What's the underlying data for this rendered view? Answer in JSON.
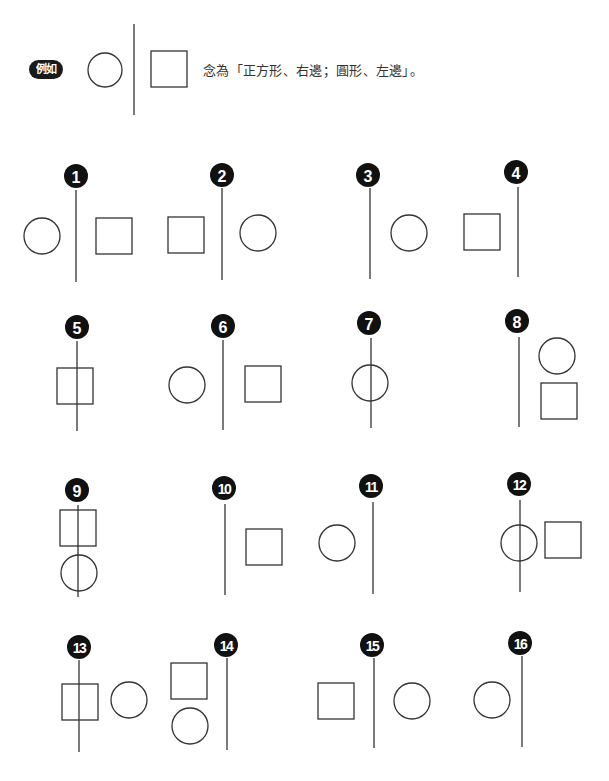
{
  "example": {
    "badge_label": "例如",
    "description": "念為「正方形、右邊；圓形、左邊」。",
    "figure": {
      "line": {
        "x": 134,
        "y1": 24,
        "y2": 115
      },
      "shapes": [
        {
          "type": "circle",
          "cx": 105,
          "cy": 70,
          "r": 17
        },
        {
          "type": "square",
          "x": 151,
          "y": 51,
          "size": 36
        }
      ]
    }
  },
  "exercises": [
    {
      "number": "1",
      "badge": {
        "cx": 76,
        "cy": 176
      },
      "line": {
        "x": 76,
        "y1": 190,
        "y2": 282
      },
      "shapes": [
        {
          "type": "circle",
          "cx": 42,
          "cy": 236,
          "r": 18
        },
        {
          "type": "square",
          "x": 96,
          "y": 218,
          "size": 36
        }
      ]
    },
    {
      "number": "2",
      "badge": {
        "cx": 222,
        "cy": 175
      },
      "line": {
        "x": 222,
        "y1": 188,
        "y2": 280
      },
      "shapes": [
        {
          "type": "square",
          "x": 168,
          "y": 217,
          "size": 36
        },
        {
          "type": "circle",
          "cx": 258,
          "cy": 233,
          "r": 18
        }
      ]
    },
    {
      "number": "3",
      "badge": {
        "cx": 368,
        "cy": 175
      },
      "line": {
        "x": 370,
        "y1": 188,
        "y2": 279
      },
      "shapes": [
        {
          "type": "circle",
          "cx": 409,
          "cy": 233,
          "r": 18
        }
      ]
    },
    {
      "number": "4",
      "badge": {
        "cx": 516,
        "cy": 172
      },
      "line": {
        "x": 518,
        "y1": 187,
        "y2": 277
      },
      "shapes": [
        {
          "type": "square",
          "x": 464,
          "y": 214,
          "size": 36
        }
      ]
    },
    {
      "number": "5",
      "badge": {
        "cx": 77,
        "cy": 327
      },
      "line": {
        "x": 77,
        "y1": 341,
        "y2": 431
      },
      "shapes": [
        {
          "type": "square",
          "x": 57,
          "y": 368,
          "size": 36
        }
      ]
    },
    {
      "number": "6",
      "badge": {
        "cx": 223,
        "cy": 326
      },
      "line": {
        "x": 223,
        "y1": 340,
        "y2": 430
      },
      "shapes": [
        {
          "type": "circle",
          "cx": 187,
          "cy": 385,
          "r": 18
        },
        {
          "type": "square",
          "x": 245,
          "y": 366,
          "size": 36
        }
      ]
    },
    {
      "number": "7",
      "badge": {
        "cx": 369,
        "cy": 323
      },
      "line": {
        "x": 371,
        "y1": 338,
        "y2": 428
      },
      "shapes": [
        {
          "type": "circle",
          "cx": 370,
          "cy": 383,
          "r": 18
        }
      ]
    },
    {
      "number": "8",
      "badge": {
        "cx": 517,
        "cy": 321
      },
      "line": {
        "x": 519,
        "y1": 337,
        "y2": 427
      },
      "shapes": [
        {
          "type": "circle",
          "cx": 557,
          "cy": 356,
          "r": 18
        },
        {
          "type": "square",
          "x": 541,
          "y": 383,
          "size": 36
        }
      ]
    },
    {
      "number": "9",
      "badge": {
        "cx": 77,
        "cy": 490
      },
      "line": {
        "x": 78,
        "y1": 505,
        "y2": 597
      },
      "shapes": [
        {
          "type": "square",
          "x": 60,
          "y": 510,
          "size": 36
        },
        {
          "type": "circle",
          "cx": 79,
          "cy": 573,
          "r": 18
        }
      ]
    },
    {
      "number": "10",
      "badge": {
        "cx": 224,
        "cy": 488
      },
      "line": {
        "x": 225,
        "y1": 504,
        "y2": 595
      },
      "shapes": [
        {
          "type": "square",
          "x": 246,
          "y": 529,
          "size": 36
        }
      ]
    },
    {
      "number": "11",
      "badge": {
        "cx": 371,
        "cy": 486
      },
      "line": {
        "x": 373,
        "y1": 502,
        "y2": 594
      },
      "shapes": [
        {
          "type": "circle",
          "cx": 337,
          "cy": 543,
          "r": 18
        }
      ]
    },
    {
      "number": "12",
      "badge": {
        "cx": 519,
        "cy": 484
      },
      "line": {
        "x": 520,
        "y1": 500,
        "y2": 592
      },
      "shapes": [
        {
          "type": "circle",
          "cx": 519,
          "cy": 543,
          "r": 18
        },
        {
          "type": "square",
          "x": 545,
          "y": 522,
          "size": 36
        }
      ]
    },
    {
      "number": "13",
      "badge": {
        "cx": 79,
        "cy": 647
      },
      "line": {
        "x": 79,
        "y1": 660,
        "y2": 752
      },
      "shapes": [
        {
          "type": "square",
          "x": 62,
          "y": 684,
          "size": 36
        },
        {
          "type": "circle",
          "cx": 129,
          "cy": 700,
          "r": 18
        }
      ]
    },
    {
      "number": "14",
      "badge": {
        "cx": 226,
        "cy": 645
      },
      "line": {
        "x": 227,
        "y1": 658,
        "y2": 750
      },
      "shapes": [
        {
          "type": "square",
          "x": 171,
          "y": 663,
          "size": 36
        },
        {
          "type": "circle",
          "cx": 190,
          "cy": 726,
          "r": 18
        }
      ]
    },
    {
      "number": "15",
      "badge": {
        "cx": 372,
        "cy": 645
      },
      "line": {
        "x": 374,
        "y1": 658,
        "y2": 748
      },
      "shapes": [
        {
          "type": "square",
          "x": 318,
          "y": 683,
          "size": 36
        },
        {
          "type": "circle",
          "cx": 412,
          "cy": 701,
          "r": 18
        }
      ]
    },
    {
      "number": "16",
      "badge": {
        "cx": 520,
        "cy": 643
      },
      "line": {
        "x": 522,
        "y1": 656,
        "y2": 747
      },
      "shapes": [
        {
          "type": "circle",
          "cx": 492,
          "cy": 700,
          "r": 18
        }
      ]
    }
  ],
  "colors": {
    "stroke": "#333333",
    "badge": "#111111",
    "badge_text": "#ffffff"
  }
}
